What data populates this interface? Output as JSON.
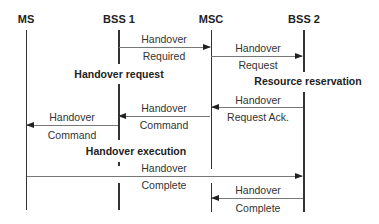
{
  "participants": [
    {
      "id": "ms",
      "label": "MS"
    },
    {
      "id": "bss1",
      "label": "BSS 1"
    },
    {
      "id": "msc",
      "label": "MSC"
    },
    {
      "id": "bss2",
      "label": "BSS 2"
    }
  ],
  "messages": [
    {
      "from": "BSS 1",
      "to": "MSC",
      "line1": "Handover",
      "line2": "Required"
    },
    {
      "from": "MSC",
      "to": "BSS 2",
      "line1": "Handover",
      "line2": "Request"
    },
    {
      "from": "BSS 2",
      "to": "MSC",
      "line1": "Handover",
      "line2": "Request Ack."
    },
    {
      "from": "MSC",
      "to": "BSS 1",
      "line1": "Handover",
      "line2": "Command"
    },
    {
      "from": "BSS 1",
      "to": "MS",
      "line1": "Handover",
      "line2": "Command"
    },
    {
      "from": "MS",
      "to": "BSS 2",
      "line1": "Handover",
      "line2": "Complete"
    },
    {
      "from": "BSS 2",
      "to": "MSC",
      "line1": "Handover",
      "line2": "Complete"
    }
  ],
  "phases": [
    {
      "label": "Handover request"
    },
    {
      "label": "Resource reservation"
    },
    {
      "label": "Handover execution"
    }
  ]
}
